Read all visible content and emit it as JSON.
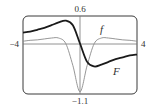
{
  "chart_data": {
    "type": "line",
    "title": "",
    "xlabel": "",
    "ylabel": "",
    "xlim": [
      -4,
      4
    ],
    "ylim": [
      -1.1,
      0.6
    ],
    "grid": false,
    "legend": "inline labels",
    "tick_labels": {
      "x_min": "−4",
      "x_max": "4",
      "y_max": "0.6",
      "y_min": "−1.1"
    },
    "x": [
      -4,
      -3.5,
      -3,
      -2.5,
      -2,
      -1.5,
      -1,
      -0.5,
      0,
      0.5,
      1,
      1.5,
      2,
      2.5,
      3,
      3.5,
      4
    ],
    "series": [
      {
        "name": "f",
        "style": "thin",
        "values": [
          0.05,
          0.07,
          0.08,
          0.1,
          0.12,
          0.12,
          0,
          -0.48,
          -1.05,
          -0.48,
          0,
          0.12,
          0.12,
          0.1,
          0.08,
          0.07,
          0.05
        ]
      },
      {
        "name": "F",
        "style": "thick",
        "values": [
          0.24,
          0.26,
          0.3,
          0.34,
          0.4,
          0.46,
          0.5,
          0.4,
          0,
          -0.4,
          -0.5,
          -0.46,
          -0.4,
          -0.34,
          -0.3,
          -0.26,
          -0.24
        ]
      }
    ],
    "annotations": [
      {
        "text": "f",
        "x": 1.5,
        "y": 0.3
      },
      {
        "text": "F",
        "x": 2.5,
        "y": -0.6
      }
    ]
  },
  "labels": {
    "x_min": "−4",
    "x_max": "4",
    "y_max": "0.6",
    "y_min": "−1.1",
    "f": "f",
    "F": "F"
  },
  "colors": {
    "frame": "#3a3a3a",
    "axis": "#777777",
    "f_curve": "#8a8a8a",
    "F_curve": "#1a1a1a"
  }
}
